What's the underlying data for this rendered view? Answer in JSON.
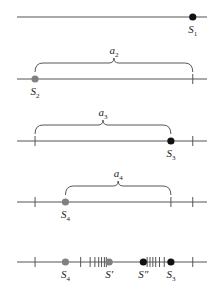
{
  "diagram": {
    "colors": {
      "gray_point": "#808080",
      "black_point": "#111111",
      "line": "#555555"
    },
    "rows": [
      {
        "id": "row1",
        "points": [
          {
            "label": "S",
            "sub": "1",
            "color": "black",
            "x": 0.925
          }
        ],
        "ticks": [],
        "brace": null
      },
      {
        "id": "row2",
        "points": [
          {
            "label": "S",
            "sub": "2",
            "color": "gray",
            "x": 0.095
          }
        ],
        "ticks": [
          0.925
        ],
        "brace": {
          "label": "a",
          "sub": "2",
          "from": 0.095,
          "to": 0.925
        }
      },
      {
        "id": "row3",
        "points": [
          {
            "label": "S",
            "sub": "3",
            "color": "black",
            "x": 0.81
          }
        ],
        "ticks": [
          0.095,
          0.925
        ],
        "brace": {
          "label": "a",
          "sub": "3",
          "from": 0.095,
          "to": 0.81
        }
      },
      {
        "id": "row4",
        "points": [
          {
            "label": "S",
            "sub": "4",
            "color": "gray",
            "x": 0.255
          }
        ],
        "ticks": [
          0.095,
          0.81,
          0.925
        ],
        "brace": {
          "label": "a",
          "sub": "4",
          "from": 0.255,
          "to": 0.81
        }
      },
      {
        "id": "row5",
        "points": [
          {
            "label": "S",
            "sub": "4",
            "color": "gray",
            "x": 0.255
          },
          {
            "label": "S′",
            "sub": "",
            "color": "gray",
            "x": 0.485
          },
          {
            "label": "S″",
            "sub": "",
            "color": "black",
            "x": 0.665
          },
          {
            "label": "S",
            "sub": "3",
            "color": "black",
            "x": 0.81
          }
        ],
        "ticks": [
          0.095,
          0.335,
          0.385,
          0.41,
          0.43,
          0.445,
          0.46,
          0.47,
          0.685,
          0.7,
          0.715,
          0.73,
          0.75,
          0.775,
          0.925
        ],
        "brace": null
      }
    ]
  }
}
